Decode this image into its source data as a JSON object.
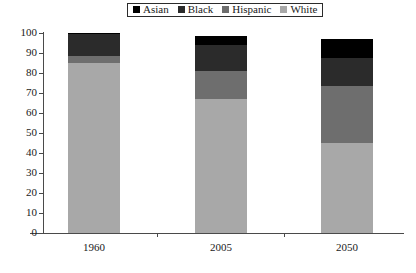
{
  "legend": {
    "position": "top-center",
    "items": [
      {
        "label": "Asian",
        "color": "#000000"
      },
      {
        "label": "Black",
        "color": "#2b2b2b"
      },
      {
        "label": "Hispanic",
        "color": "#6e6e6e"
      },
      {
        "label": "White",
        "color": "#a8a8a8"
      }
    ]
  },
  "axes": {
    "y_ticks": [
      "100",
      "90",
      "80",
      "70",
      "60",
      "50",
      "40",
      "30",
      "20",
      "10",
      "0"
    ],
    "x_ticks": [
      "1960",
      "2005",
      "2050"
    ]
  },
  "chart_data": {
    "type": "bar",
    "subtype": "stacked-bar",
    "title": "",
    "xlabel": "",
    "ylabel": "",
    "ylim": [
      0,
      100
    ],
    "ytick_step": 10,
    "grid": false,
    "legend_position": "top-center",
    "categories": [
      "1960",
      "2005",
      "2050"
    ],
    "series": [
      {
        "name": "White",
        "color": "#a8a8a8",
        "values": [
          85,
          67,
          45
        ]
      },
      {
        "name": "Hispanic",
        "color": "#6e6e6e",
        "values": [
          3.5,
          14,
          28.5
        ]
      },
      {
        "name": "Black",
        "color": "#2b2b2b",
        "values": [
          11,
          13,
          14
        ]
      },
      {
        "name": "Asian",
        "color": "#000000",
        "values": [
          0.5,
          4.5,
          9.5
        ]
      }
    ],
    "totals": [
      100,
      98.5,
      97
    ],
    "stack_order_bottom_to_top": [
      "White",
      "Hispanic",
      "Black",
      "Asian"
    ]
  }
}
